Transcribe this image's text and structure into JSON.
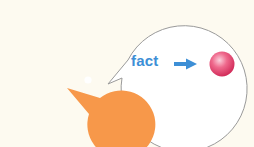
{
  "illustration": {
    "character": {
      "name": "pacman-character",
      "color": "#f7984a",
      "eye_color": "#ffffff"
    },
    "speech_bubble": {
      "stroke_color": "#9a9a9a",
      "fill_color": "#ffffff",
      "text": "fact",
      "text_color": "#3d8fd6",
      "arrow_color": "#3d8fd6",
      "ball_color": "#e8406a"
    },
    "background_color": "#fdfaf0"
  }
}
